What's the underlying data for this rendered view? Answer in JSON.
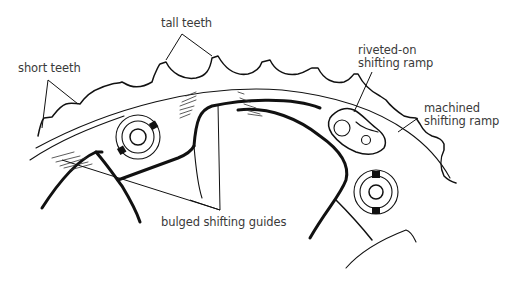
{
  "diagram": {
    "labels": {
      "tall_teeth": "tall teeth",
      "short_teeth": "short teeth",
      "riveted_ramp_line1": "riveted-on",
      "riveted_ramp_line2": "shifting ramp",
      "machined_ramp_line1": "machined",
      "machined_ramp_line2": "shifting ramp",
      "bulged_guides": "bulged shifting guides"
    },
    "colors": {
      "line": "#111111",
      "text": "#3a3a3a",
      "background": "#ffffff"
    }
  }
}
